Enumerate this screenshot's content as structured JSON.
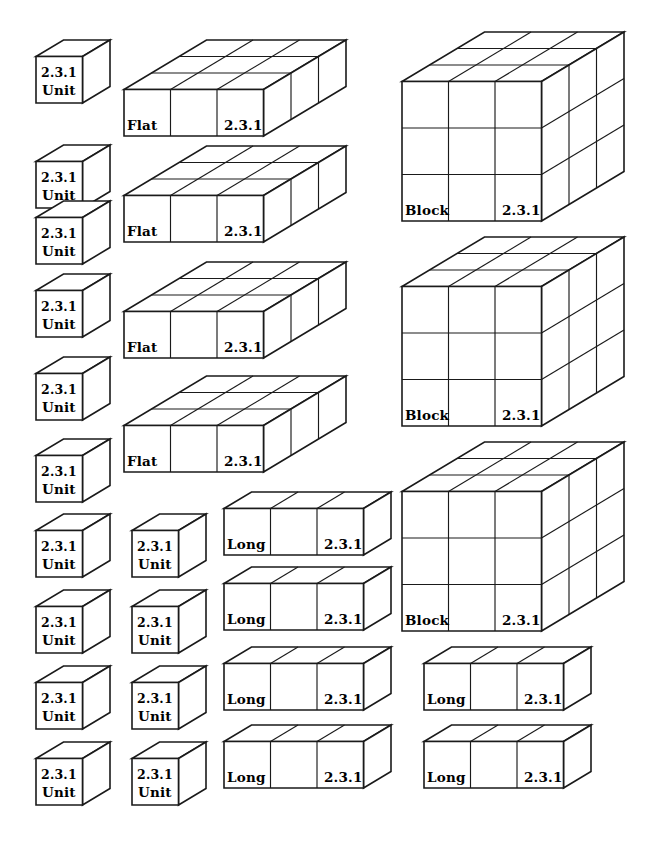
{
  "page": {
    "background_color": "#ffffff",
    "line_color": "#1a1a1a",
    "text_color": "#000000",
    "width": 663,
    "height": 845
  },
  "labels": {
    "unit": "Unit",
    "long": "Long",
    "flat": "Flat",
    "block": "Block",
    "code": "2.3.1"
  },
  "legend": {
    "unit_dims": "1 x 1 x 1",
    "long_dims": "3 x 1 x 1",
    "flat_dims": "3 x 1 x 3",
    "block_dims": "3 x 3 x 3"
  },
  "counts": {
    "unit": 13,
    "long": 6,
    "flat": 4,
    "block": 3
  },
  "shapes": [
    {
      "kind": "unit",
      "name": "Unit",
      "code": "2.3.1",
      "x": 34,
      "y": 38,
      "nx": 1,
      "ny": 1,
      "nz": 1
    },
    {
      "kind": "unit",
      "name": "Unit",
      "code": "2.3.1",
      "x": 34,
      "y": 143,
      "nx": 1,
      "ny": 1,
      "nz": 1
    },
    {
      "kind": "unit",
      "name": "Unit",
      "code": "2.3.1",
      "x": 34,
      "y": 199,
      "nx": 1,
      "ny": 1,
      "nz": 1
    },
    {
      "kind": "unit",
      "name": "Unit",
      "code": "2.3.1",
      "x": 34,
      "y": 272,
      "nx": 1,
      "ny": 1,
      "nz": 1
    },
    {
      "kind": "unit",
      "name": "Unit",
      "code": "2.3.1",
      "x": 34,
      "y": 355,
      "nx": 1,
      "ny": 1,
      "nz": 1
    },
    {
      "kind": "unit",
      "name": "Unit",
      "code": "2.3.1",
      "x": 34,
      "y": 437,
      "nx": 1,
      "ny": 1,
      "nz": 1
    },
    {
      "kind": "unit",
      "name": "Unit",
      "code": "2.3.1",
      "x": 34,
      "y": 512,
      "nx": 1,
      "ny": 1,
      "nz": 1
    },
    {
      "kind": "unit",
      "name": "Unit",
      "code": "2.3.1",
      "x": 34,
      "y": 588,
      "nx": 1,
      "ny": 1,
      "nz": 1
    },
    {
      "kind": "unit",
      "name": "Unit",
      "code": "2.3.1",
      "x": 34,
      "y": 664,
      "nx": 1,
      "ny": 1,
      "nz": 1
    },
    {
      "kind": "unit",
      "name": "Unit",
      "code": "2.3.1",
      "x": 34,
      "y": 740,
      "nx": 1,
      "ny": 1,
      "nz": 1
    },
    {
      "kind": "unit",
      "name": "Unit",
      "code": "2.3.1",
      "x": 130,
      "y": 512,
      "nx": 1,
      "ny": 1,
      "nz": 1
    },
    {
      "kind": "unit",
      "name": "Unit",
      "code": "2.3.1",
      "x": 130,
      "y": 588,
      "nx": 1,
      "ny": 1,
      "nz": 1
    },
    {
      "kind": "unit",
      "name": "Unit",
      "code": "2.3.1",
      "x": 130,
      "y": 664,
      "nx": 1,
      "ny": 1,
      "nz": 1
    },
    {
      "kind": "unit",
      "name": "Unit",
      "code": "2.3.1",
      "x": 130,
      "y": 740,
      "nx": 1,
      "ny": 1,
      "nz": 1
    },
    {
      "kind": "flat",
      "name": "Flat",
      "code": "2.3.1",
      "x": 122,
      "y": 38,
      "nx": 3,
      "ny": 1,
      "nz": 3
    },
    {
      "kind": "flat",
      "name": "Flat",
      "code": "2.3.1",
      "x": 122,
      "y": 144,
      "nx": 3,
      "ny": 1,
      "nz": 3
    },
    {
      "kind": "flat",
      "name": "Flat",
      "code": "2.3.1",
      "x": 122,
      "y": 260,
      "nx": 3,
      "ny": 1,
      "nz": 3
    },
    {
      "kind": "flat",
      "name": "Flat",
      "code": "2.3.1",
      "x": 122,
      "y": 374,
      "nx": 3,
      "ny": 1,
      "nz": 3
    },
    {
      "kind": "long",
      "name": "Long",
      "code": "2.3.1",
      "x": 222,
      "y": 490,
      "nx": 3,
      "ny": 1,
      "nz": 1
    },
    {
      "kind": "long",
      "name": "Long",
      "code": "2.3.1",
      "x": 222,
      "y": 565,
      "nx": 3,
      "ny": 1,
      "nz": 1
    },
    {
      "kind": "long",
      "name": "Long",
      "code": "2.3.1",
      "x": 222,
      "y": 645,
      "nx": 3,
      "ny": 1,
      "nz": 1
    },
    {
      "kind": "long",
      "name": "Long",
      "code": "2.3.1",
      "x": 222,
      "y": 723,
      "nx": 3,
      "ny": 1,
      "nz": 1
    },
    {
      "kind": "long",
      "name": "Long",
      "code": "2.3.1",
      "x": 422,
      "y": 645,
      "nx": 3,
      "ny": 1,
      "nz": 1
    },
    {
      "kind": "long",
      "name": "Long",
      "code": "2.3.1",
      "x": 422,
      "y": 723,
      "nx": 3,
      "ny": 1,
      "nz": 1
    },
    {
      "kind": "block",
      "name": "Block",
      "code": "2.3.1",
      "x": 400,
      "y": 30,
      "nx": 3,
      "ny": 3,
      "nz": 3
    },
    {
      "kind": "block",
      "name": "Block",
      "code": "2.3.1",
      "x": 400,
      "y": 235,
      "nx": 3,
      "ny": 3,
      "nz": 3
    },
    {
      "kind": "block",
      "name": "Block",
      "code": "2.3.1",
      "x": 400,
      "y": 440,
      "nx": 3,
      "ny": 3,
      "nz": 3
    }
  ]
}
